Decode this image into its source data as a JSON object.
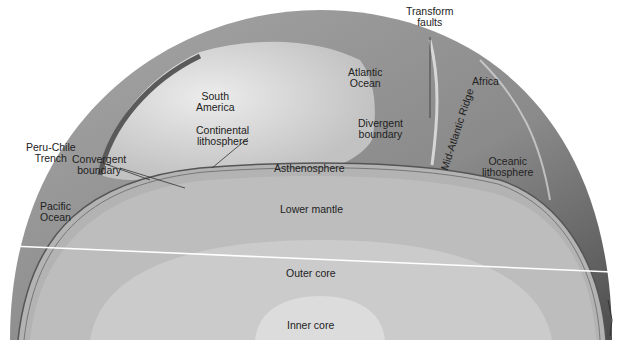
{
  "diagram": {
    "colors": {
      "background": "#ffffff",
      "surface_ocean": "#8e8e8e",
      "surface_continent": "#d6d6d6",
      "asthenosphere": "#b5b5b5",
      "lower_mantle": "#c4c4c4",
      "outer_core": "#d0d0d0",
      "inner_core": "#dedede",
      "label_text": "#222222"
    },
    "labels": {
      "transform_faults": [
        "Transform",
        "faults"
      ],
      "atlantic_ocean": [
        "Atlantic",
        "Ocean"
      ],
      "africa": "Africa",
      "south_america": [
        "South",
        "America"
      ],
      "peru_chile_trench": [
        "Peru-Chile",
        "Trench"
      ],
      "continental_lithosphere": [
        "Continental",
        "lithosphere"
      ],
      "divergent_boundary": [
        "Divergent",
        "boundary"
      ],
      "mid_atlantic_ridge": "Mid-Atlantic Ridge",
      "convergent_boundary": [
        "Convergent",
        "boundary"
      ],
      "oceanic_lithosphere": [
        "Oceanic",
        "lithosphere"
      ],
      "pacific_ocean": [
        "Pacific",
        "Ocean"
      ],
      "asthenosphere": "Asthenosphere",
      "lower_mantle": "Lower mantle",
      "outer_core": "Outer core",
      "inner_core": "Inner core"
    }
  }
}
